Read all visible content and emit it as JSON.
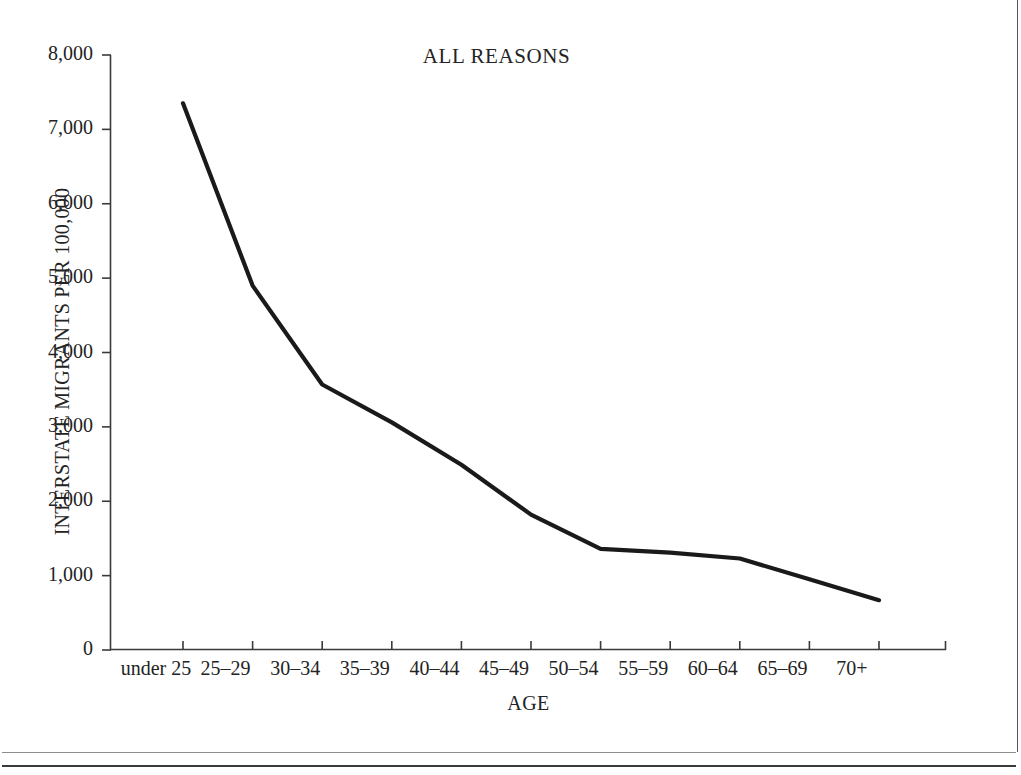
{
  "chart_data": {
    "type": "line",
    "title": "ALL REASONS",
    "xlabel": "AGE",
    "ylabel": "INTERSTATE MIGRANTS PER 100,000",
    "categories": [
      "under 25",
      "25–29",
      "30–34",
      "35–39",
      "40–44",
      "45–49",
      "50–54",
      "55–59",
      "60–64",
      "65–69",
      "70+"
    ],
    "values": [
      7350,
      4900,
      3570,
      3060,
      2490,
      1820,
      1360,
      1310,
      1230,
      950,
      670
    ],
    "series": [
      {
        "name": "All reasons",
        "values": [
          7350,
          4900,
          3570,
          3060,
          2490,
          1820,
          1360,
          1310,
          1230,
          950,
          670
        ]
      }
    ],
    "ylim": [
      0,
      8000
    ],
    "ytick_labels": [
      "8,000",
      "7,000",
      "6,000",
      "5,000",
      "4,000",
      "3,000",
      "2,000",
      "1,000",
      "0"
    ],
    "ytick_values": [
      8000,
      7000,
      6000,
      5000,
      4000,
      3000,
      2000,
      1000,
      0
    ],
    "grid": false,
    "legend": "none",
    "line_color": "#1a1a1a",
    "axis_color": "#3a3a3a",
    "background_color": "#ffffff"
  }
}
